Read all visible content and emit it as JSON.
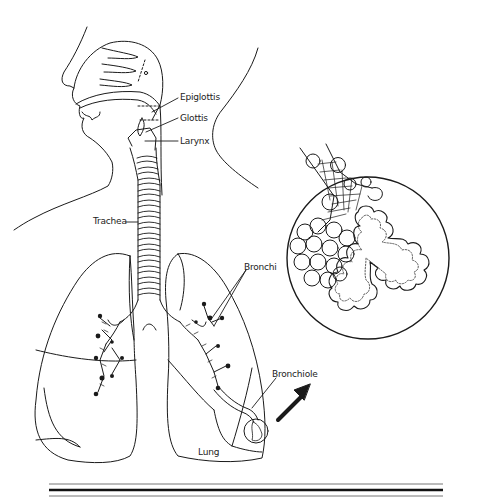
{
  "diagram": {
    "labels": {
      "epiglottis": "Epiglottis",
      "glottis": "Glottis",
      "larynx": "Larynx",
      "trachea": "Trachea",
      "bronchi": "Bronchi",
      "bronchiole": "Bronchiole",
      "lung": "Lung"
    },
    "inset": {
      "description": "Magnified alveoli cluster",
      "arrow": "arrow-up-right"
    },
    "colors": {
      "ink": "#1a1a1a",
      "background": "#ffffff"
    }
  }
}
